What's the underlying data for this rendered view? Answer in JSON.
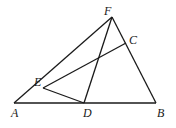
{
  "diagram": {
    "points": {
      "A": {
        "label": "A",
        "x": 14,
        "y": 103,
        "lx": 11,
        "ly": 117
      },
      "B": {
        "label": "B",
        "x": 156,
        "y": 103,
        "lx": 157,
        "ly": 117
      },
      "C": {
        "label": "C",
        "x": 126,
        "y": 43,
        "lx": 129,
        "ly": 44
      },
      "D": {
        "label": "D",
        "x": 84,
        "y": 103,
        "lx": 83,
        "ly": 117
      },
      "E": {
        "label": "E",
        "x": 43,
        "y": 88,
        "lx": 34,
        "ly": 86
      },
      "F": {
        "label": "F",
        "x": 112,
        "y": 17,
        "lx": 104,
        "ly": 15
      }
    },
    "segments": [
      [
        "A",
        "B"
      ],
      [
        "A",
        "F"
      ],
      [
        "F",
        "B"
      ],
      [
        "F",
        "D"
      ],
      [
        "E",
        "C"
      ],
      [
        "E",
        "D"
      ]
    ]
  }
}
